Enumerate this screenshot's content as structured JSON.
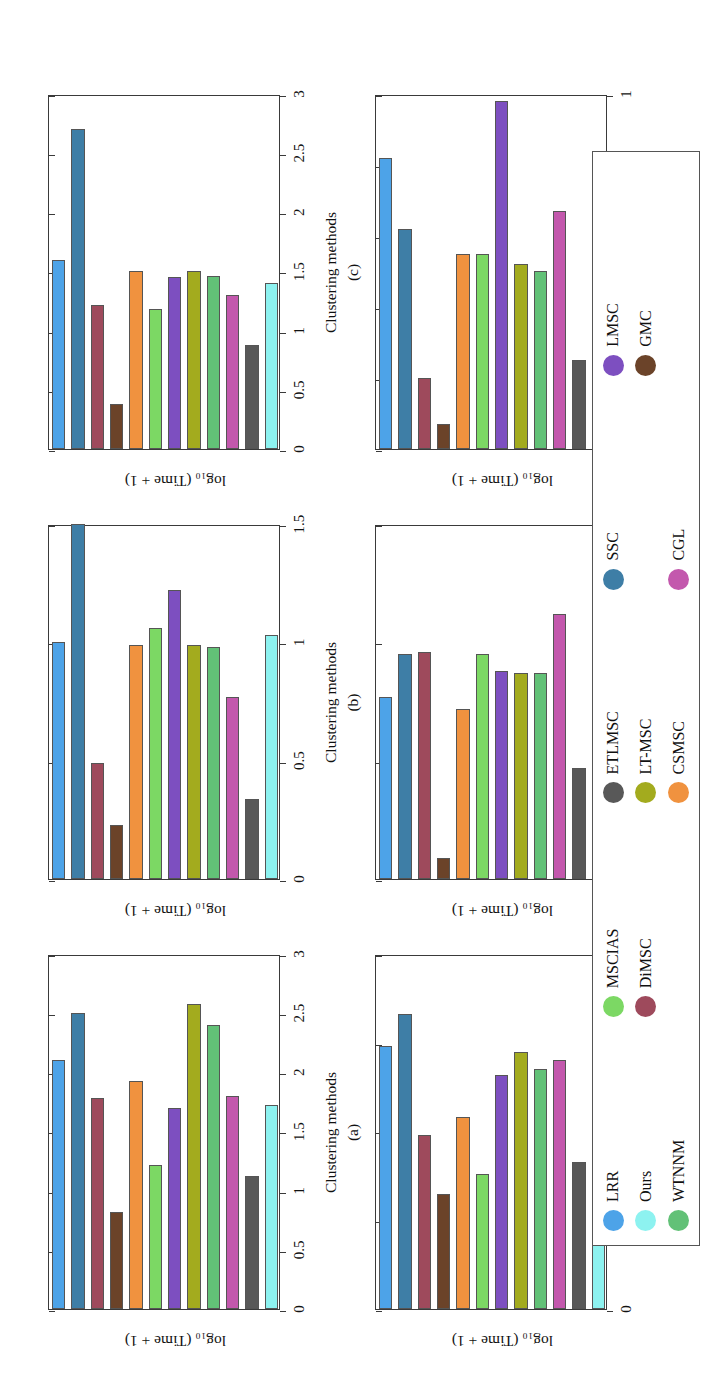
{
  "figure": {
    "axis_label_y": "log₁₀ (Time + 1)",
    "axis_label_x": "Clustering methods"
  },
  "legend": {
    "items": [
      {
        "label": "LRR",
        "color": "#4da3e8"
      },
      {
        "label": "SSC",
        "color": "#3e7ea6"
      },
      {
        "label": "DiMSC",
        "color": "#9e4a5c"
      },
      {
        "label": "GMC",
        "color": "#6b4329"
      },
      {
        "label": "CSMSC",
        "color": "#f0923f"
      },
      {
        "label": "MSCIAS",
        "color": "#7cd864"
      },
      {
        "label": "LMSC",
        "color": "#7d4fc0"
      },
      {
        "label": "LT-MSC",
        "color": "#a3ab1e"
      },
      {
        "label": "WTNNM",
        "color": "#62c177"
      },
      {
        "label": "CGL",
        "color": "#c358ad"
      },
      {
        "label": "ETLMSC",
        "color": "#585858"
      },
      {
        "label": "Ours",
        "color": "#8df2f0"
      },
      {
        "label": "",
        "color": "#ffffff"
      },
      {
        "label": "",
        "color": "#ffffff"
      },
      {
        "label": "",
        "color": "#ffffff"
      }
    ]
  },
  "chart_data": [
    {
      "type": "bar",
      "panel": "(a)",
      "xlabel": "Clustering methods",
      "ylabel": "log₁₀ (Time + 1)",
      "ylim": [
        0,
        3
      ],
      "yticks": [
        0,
        0.5,
        1,
        1.5,
        2,
        2.5,
        3
      ],
      "yticklabels": [
        "0",
        "0.5",
        "1",
        "1.5",
        "2",
        "2.5",
        "3"
      ],
      "grid": false,
      "categories": [
        "LRR",
        "SSC",
        "DiMSC",
        "GMC",
        "CSMSC",
        "MSCIAS",
        "LMSC",
        "LT-MSC",
        "WTNNM",
        "CGL",
        "ETLMSC",
        "Ours"
      ],
      "values": [
        2.1,
        2.5,
        1.78,
        0.82,
        1.93,
        1.22,
        1.7,
        2.58,
        2.4,
        1.8,
        1.12,
        1.72
      ]
    },
    {
      "type": "bar",
      "panel": "(b)",
      "xlabel": "Clustering methods",
      "ylabel": "log₁₀ (Time + 1)",
      "ylim": [
        0,
        1.5
      ],
      "yticks": [
        0,
        0.5,
        1,
        1.5
      ],
      "yticklabels": [
        "0",
        "0.5",
        "1",
        "1.5"
      ],
      "grid": false,
      "categories": [
        "LRR",
        "SSC",
        "DiMSC",
        "GMC",
        "CSMSC",
        "MSCIAS",
        "LMSC",
        "LT-MSC",
        "WTNNM",
        "CGL",
        "ETLMSC",
        "Ours"
      ],
      "values": [
        1.0,
        1.56,
        0.49,
        0.23,
        0.99,
        1.06,
        1.22,
        0.99,
        0.98,
        0.77,
        0.34,
        1.03
      ]
    },
    {
      "type": "bar",
      "panel": "(c)",
      "xlabel": "Clustering methods",
      "ylabel": "log₁₀ (Time + 1)",
      "ylim": [
        0,
        3
      ],
      "yticks": [
        0,
        0.5,
        1,
        1.5,
        2,
        2.5,
        3
      ],
      "yticklabels": [
        "0",
        "0.5",
        "1",
        "1.5",
        "2",
        "2.5",
        "3"
      ],
      "grid": false,
      "categories": [
        "LRR",
        "SSC",
        "DiMSC",
        "GMC",
        "CSMSC",
        "MSCIAS",
        "LMSC",
        "LT-MSC",
        "WTNNM",
        "CGL",
        "ETLMSC",
        "Ours"
      ],
      "values": [
        1.6,
        2.7,
        1.22,
        0.38,
        1.5,
        1.18,
        1.45,
        1.5,
        1.46,
        1.3,
        0.88,
        1.4
      ]
    },
    {
      "type": "bar",
      "panel": "(d)",
      "xlabel": "Clustering methods",
      "ylabel": "log₁₀ (Time + 1)",
      "ylim": [
        0,
        2
      ],
      "yticks": [
        0,
        0.5,
        1,
        1.5,
        2
      ],
      "yticklabels": [
        "0",
        "0.5",
        "1",
        "1.5",
        "2"
      ],
      "grid": false,
      "categories": [
        "LRR",
        "SSC",
        "DiMSC",
        "GMC",
        "CSMSC",
        "MSCIAS",
        "LMSC",
        "LT-MSC",
        "WTNNM",
        "CGL",
        "ETLMSC",
        "Ours"
      ],
      "values": [
        1.48,
        1.66,
        0.98,
        0.65,
        1.08,
        0.76,
        1.32,
        1.45,
        1.35,
        1.4,
        0.83,
        1.52
      ]
    },
    {
      "type": "bar",
      "panel": "(e)",
      "xlabel": "Clustering methods",
      "ylabel": "log₁₀ (Time + 1)",
      "ylim": [
        0,
        1.5
      ],
      "yticks": [
        0,
        0.5,
        1,
        1.5
      ],
      "yticklabels": [
        "0",
        "0.5",
        "1",
        "1.5"
      ],
      "grid": false,
      "categories": [
        "LRR",
        "SSC",
        "DiMSC",
        "GMC",
        "CSMSC",
        "MSCIAS",
        "LMSC",
        "LT-MSC",
        "WTNNM",
        "CGL",
        "ETLMSC",
        "Ours"
      ],
      "values": [
        0.77,
        0.95,
        0.96,
        0.09,
        0.72,
        0.95,
        0.88,
        0.87,
        0.87,
        1.12,
        0.47,
        1.2
      ]
    },
    {
      "type": "bar",
      "panel": "(f)",
      "xlabel": "Clustering methods",
      "ylabel": "log₁₀ (Time + 1)",
      "ylim": [
        0,
        1
      ],
      "yticks": [
        0,
        0.2,
        0.4,
        0.6,
        0.8,
        1
      ],
      "yticklabels": [
        "0",
        "0.2",
        "0.4",
        "0.6",
        "0.8",
        "1"
      ],
      "grid": false,
      "categories": [
        "LRR",
        "SSC",
        "DiMSC",
        "GMC",
        "CSMSC",
        "MSCIAS",
        "LMSC",
        "LT-MSC",
        "WTNNM",
        "CGL",
        "ETLMSC",
        "Ours"
      ],
      "values": [
        0.82,
        0.62,
        0.2,
        0.07,
        0.55,
        0.55,
        0.98,
        0.52,
        0.5,
        0.67,
        0.25,
        0.66
      ]
    }
  ]
}
